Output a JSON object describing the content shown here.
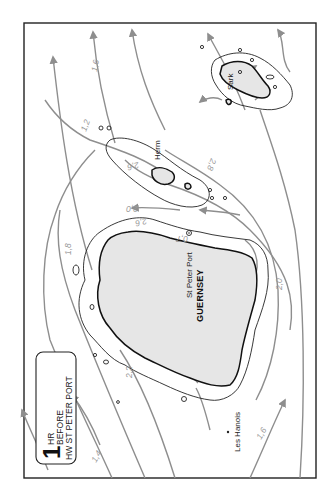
{
  "title": {
    "number": "1",
    "line1": "HR",
    "line2": "BEFORE",
    "line3": "HW ST PETER PORT"
  },
  "places": {
    "guernsey": "GUERNSEY",
    "st_peter_port": "St Peter Port",
    "herm": "Herm",
    "sark": "Sark",
    "les_hanois": "Les Hanois"
  },
  "rates": {
    "r1": "1,6",
    "r2": "1,2",
    "r3": "2,6",
    "r4": "2,8",
    "r5": "2,6",
    "r6": "2,0",
    "r7": "0,7",
    "r8": "1,8",
    "r9": "2,2",
    "r10": "1,4",
    "r11": "1,6",
    "r12": "2,0"
  },
  "colors": {
    "stream": "#8e8e8e",
    "land": "#e6e6e6",
    "coast": "#111111"
  }
}
